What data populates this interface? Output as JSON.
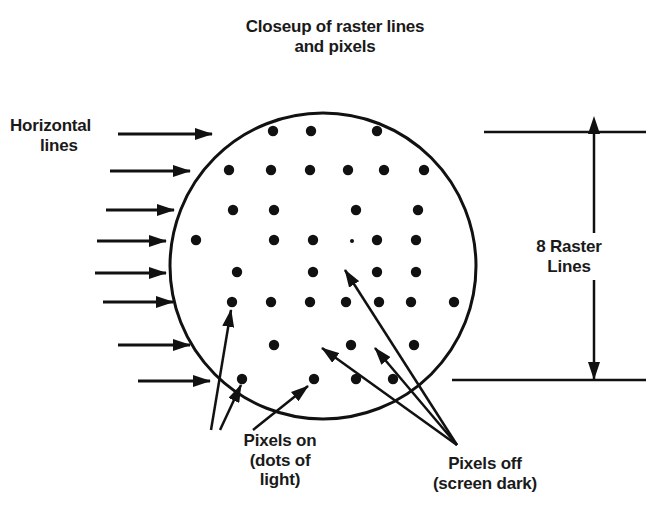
{
  "title": {
    "line1": "Closeup of raster lines",
    "line2": "and pixels"
  },
  "labels": {
    "horizontal_lines": {
      "line1": "Horizontal",
      "line2": "lines"
    },
    "raster_count": {
      "line1": "8 Raster",
      "line2": "Lines"
    },
    "pixels_on": {
      "line1": "Pixels on",
      "line2": "(dots of",
      "line3": "light)"
    },
    "pixels_off": {
      "line1": "Pixels off",
      "line2": "(screen dark)"
    }
  },
  "diagram": {
    "circle": {
      "cx": 323,
      "cy": 266,
      "r": 153
    },
    "raster_line_count": 8,
    "raster_rows_y": [
      132,
      170,
      210,
      240,
      272,
      302,
      345,
      380
    ],
    "pixels": [
      {
        "x": 273,
        "y": 131
      },
      {
        "x": 311,
        "y": 131
      },
      {
        "x": 377,
        "y": 131
      },
      {
        "x": 229,
        "y": 170
      },
      {
        "x": 271,
        "y": 170
      },
      {
        "x": 310,
        "y": 170
      },
      {
        "x": 348,
        "y": 170
      },
      {
        "x": 384,
        "y": 170
      },
      {
        "x": 424,
        "y": 170
      },
      {
        "x": 233,
        "y": 210
      },
      {
        "x": 274,
        "y": 210
      },
      {
        "x": 356,
        "y": 210
      },
      {
        "x": 418,
        "y": 210
      },
      {
        "x": 196,
        "y": 240
      },
      {
        "x": 274,
        "y": 240
      },
      {
        "x": 313,
        "y": 240
      },
      {
        "x": 377,
        "y": 240
      },
      {
        "x": 416,
        "y": 240
      },
      {
        "x": 237,
        "y": 272
      },
      {
        "x": 313,
        "y": 272
      },
      {
        "x": 377,
        "y": 272
      },
      {
        "x": 416,
        "y": 272
      },
      {
        "x": 232,
        "y": 302
      },
      {
        "x": 271,
        "y": 302
      },
      {
        "x": 310,
        "y": 302
      },
      {
        "x": 346,
        "y": 302
      },
      {
        "x": 379,
        "y": 302
      },
      {
        "x": 411,
        "y": 302
      },
      {
        "x": 454,
        "y": 302
      },
      {
        "x": 274,
        "y": 345
      },
      {
        "x": 351,
        "y": 345
      },
      {
        "x": 414,
        "y": 345
      },
      {
        "x": 242,
        "y": 379
      },
      {
        "x": 314,
        "y": 379
      },
      {
        "x": 356,
        "y": 379
      },
      {
        "x": 393,
        "y": 379
      }
    ],
    "dim_pixel": {
      "x": 352,
      "y": 241
    },
    "line_arrows": [
      {
        "x1": 118,
        "x2": 212,
        "y": 134
      },
      {
        "x1": 110,
        "x2": 190,
        "y": 171
      },
      {
        "x1": 106,
        "x2": 174,
        "y": 210
      },
      {
        "x1": 97,
        "x2": 166,
        "y": 241
      },
      {
        "x1": 95,
        "x2": 166,
        "y": 273
      },
      {
        "x1": 103,
        "x2": 173,
        "y": 302
      },
      {
        "x1": 118,
        "x2": 190,
        "y": 345
      },
      {
        "x1": 138,
        "x2": 210,
        "y": 381
      }
    ],
    "pixels_on_pointers": [
      {
        "x1": 211,
        "y1": 430,
        "x2": 231,
        "y2": 310
      },
      {
        "x1": 220,
        "y1": 430,
        "x2": 241,
        "y2": 385
      },
      {
        "x1": 253,
        "y1": 430,
        "x2": 308,
        "y2": 386
      }
    ],
    "pixels_off_pointers": [
      {
        "x1": 457,
        "y1": 445,
        "x2": 345,
        "y2": 270
      },
      {
        "x1": 457,
        "y1": 445,
        "x2": 322,
        "y2": 348
      },
      {
        "x1": 457,
        "y1": 445,
        "x2": 375,
        "y2": 348
      }
    ],
    "dimension": {
      "x": 594,
      "top_y": 132,
      "bottom_y": 380,
      "left_top": 484,
      "left_bottom": 452,
      "right": 646
    },
    "colors": {
      "ink": "#111111",
      "background": "#ffffff"
    }
  }
}
